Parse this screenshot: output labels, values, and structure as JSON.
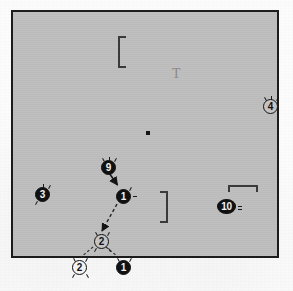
{
  "figure": {
    "background_color": "#fcfcfc",
    "field": {
      "name": "gray-field",
      "fill_color": "#bdbdbd",
      "border_color": "#1c1c1c",
      "x": 11,
      "y": 10,
      "width": 268,
      "height": 248
    },
    "markers": [
      {
        "id": "marker-9",
        "label": "9",
        "style": "filled",
        "x": 101,
        "y": 160,
        "whiskers": [
          "top-center",
          "top-left",
          "top-right"
        ]
      },
      {
        "id": "marker-1a",
        "label": "1",
        "style": "filled",
        "x": 116,
        "y": 189,
        "whiskers": [
          "top-right",
          "side-right"
        ]
      },
      {
        "id": "marker-3",
        "label": "3",
        "style": "filled",
        "x": 35,
        "y": 187,
        "whiskers": [
          "top-center",
          "top-right",
          "bottom-left"
        ]
      },
      {
        "id": "marker-4",
        "label": "4",
        "style": "outline",
        "x": 263,
        "y": 99,
        "whiskers": [
          "top-left",
          "top-center",
          "top-right"
        ]
      },
      {
        "id": "marker-10",
        "label": "10",
        "style": "filled",
        "x": 217,
        "y": 199,
        "whiskers": [
          "side-right",
          "side-right-2"
        ]
      },
      {
        "id": "marker-2a",
        "label": "2",
        "style": "outline",
        "x": 94,
        "y": 234,
        "whiskers": [
          "top-left",
          "top-right",
          "bottom-left",
          "bottom-right"
        ]
      },
      {
        "id": "marker-2b",
        "label": "2",
        "style": "outline",
        "x": 72,
        "y": 260,
        "whiskers": [
          "top-left",
          "top-right",
          "bottom-left",
          "bottom-right"
        ]
      },
      {
        "id": "marker-1b",
        "label": "1",
        "style": "filled",
        "x": 116,
        "y": 260,
        "whiskers": [
          "top-left",
          "top-right"
        ]
      }
    ],
    "glyphs": {
      "bracket_top_left": {
        "name": "bracket-left-upper",
        "x": 118,
        "y": 36,
        "width": 8,
        "height": 32
      },
      "bracket_mid_right": {
        "name": "bracket-right-mid",
        "x": 160,
        "y": 191,
        "width": 8,
        "height": 32
      },
      "bracket_scale_bar": {
        "name": "bracket-top-scalebar",
        "x": 228,
        "y": 185,
        "width": 30,
        "height": 7
      },
      "t_glyph": {
        "name": "t-glyph",
        "text": "T",
        "x": 172,
        "y": 67
      },
      "center_dot": {
        "name": "center-dot",
        "x": 146,
        "y": 131
      }
    },
    "vectors": [
      {
        "id": "arrow-9-to-1",
        "style": "solid",
        "from": [
          108,
          170
        ],
        "to": [
          118,
          185
        ],
        "label": "solid arrow from marker 9 to marker 1"
      },
      {
        "id": "arrow-1-to-2",
        "style": "dashed",
        "from": [
          117,
          204
        ],
        "to": [
          101,
          232
        ],
        "label": "dashed arrow from marker 1 to marker 2"
      },
      {
        "id": "tie-2a-2b",
        "style": "dashed",
        "from": [
          92,
          247
        ],
        "to": [
          80,
          258
        ],
        "label": "dashed tie line to lower marker 2"
      },
      {
        "id": "tie-2a-1b",
        "style": "dashed",
        "from": [
          106,
          247
        ],
        "to": [
          118,
          257
        ],
        "label": "dashed tie line to lower marker 1"
      }
    ]
  }
}
